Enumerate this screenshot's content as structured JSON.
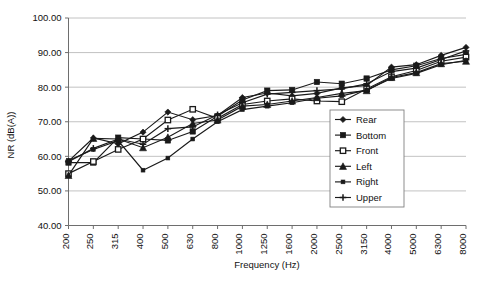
{
  "chart_data": {
    "type": "line",
    "title": "",
    "xlabel": "Frequency (Hz)",
    "ylabel": "NR (dB(A))",
    "categories": [
      "200",
      "250",
      "315",
      "400",
      "500",
      "630",
      "800",
      "1000",
      "1250",
      "1600",
      "2000",
      "2500",
      "3150",
      "4000",
      "5000",
      "6300",
      "8000"
    ],
    "ytick_labels": [
      "100.00",
      "90.00",
      "80.00",
      "70.00",
      "60.00",
      "50.00",
      "40.00"
    ],
    "ytick_values": [
      100,
      90,
      80,
      70,
      60,
      50,
      40
    ],
    "ylim": [
      40,
      100
    ],
    "grid": true,
    "legend_position": "inside-right",
    "series": [
      {
        "name": "Rear",
        "marker": "diamond",
        "values": [
          58.6,
          65.3,
          63.6,
          67.0,
          72.8,
          70.6,
          71.8,
          77.0,
          78.3,
          77.5,
          78.2,
          79.8,
          80.5,
          85.8,
          86.5,
          89.2,
          91.5
        ]
      },
      {
        "name": "Bottom",
        "marker": "square",
        "values": [
          58.2,
          58.2,
          65.4,
          65.0,
          64.6,
          67.2,
          71.6,
          76.3,
          79.0,
          79.2,
          81.5,
          81.0,
          82.5,
          85.0,
          86.2,
          88.3,
          89.5
        ]
      },
      {
        "name": "Front",
        "marker": "square-open",
        "values": [
          55.0,
          58.5,
          62.0,
          65.0,
          70.5,
          73.6,
          71.0,
          75.0,
          76.0,
          76.6,
          76.0,
          75.8,
          79.5,
          83.0,
          84.8,
          87.5,
          88.7
        ]
      },
      {
        "name": "Left",
        "marker": "triangle",
        "values": [
          54.5,
          65.2,
          65.0,
          62.5,
          65.5,
          69.5,
          70.5,
          74.5,
          75.0,
          76.0,
          77.0,
          78.2,
          79.0,
          82.8,
          84.2,
          86.8,
          87.5
        ]
      },
      {
        "name": "Right",
        "marker": "square-small",
        "values": [
          58.8,
          62.0,
          64.5,
          56.0,
          59.5,
          65.0,
          70.0,
          73.5,
          74.5,
          75.5,
          76.8,
          77.5,
          79.2,
          82.5,
          84.0,
          86.5,
          87.8
        ]
      },
      {
        "name": "Upper",
        "marker": "plus",
        "values": [
          58.4,
          62.3,
          65.0,
          63.5,
          68.0,
          68.5,
          72.0,
          75.5,
          78.0,
          78.5,
          79.0,
          79.5,
          81.0,
          84.5,
          85.5,
          88.0,
          90.5
        ]
      }
    ]
  },
  "legend": {
    "items": [
      "Rear",
      "Bottom",
      "Front",
      "Left",
      "Right",
      "Upper"
    ]
  },
  "caption": {
    "text": ""
  }
}
